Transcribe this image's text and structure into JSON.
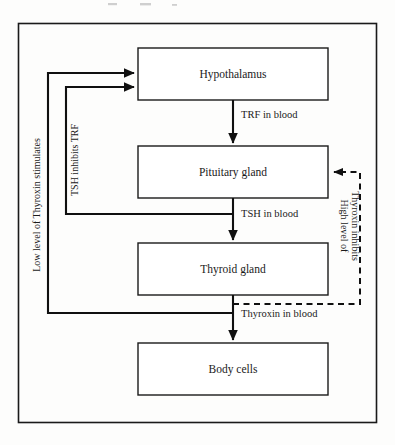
{
  "diagram": {
    "nodes": [
      {
        "id": "hypothalamus",
        "label": "Hypothalamus"
      },
      {
        "id": "pituitary",
        "label": "Pituitary gland"
      },
      {
        "id": "thyroid",
        "label": "Thyroid gland"
      },
      {
        "id": "body_cells",
        "label": "Body cells"
      }
    ],
    "edge_labels": {
      "trf": "TRF in blood",
      "tsh": "TSH in blood",
      "thyroxin": "Thyroxin in blood"
    },
    "feedback_labels": {
      "low_thyroxin": "Low level of Thyroxin stimulates",
      "tsh_inhibits": "TSH inhibits TRF",
      "high_thyroxin_line1": "High level of",
      "high_thyroxin_line2": "Thyroxin inhibits"
    },
    "colors": {
      "ink": "#1a1a1a",
      "paper": "#fdfdfc",
      "line": "#101010"
    }
  }
}
